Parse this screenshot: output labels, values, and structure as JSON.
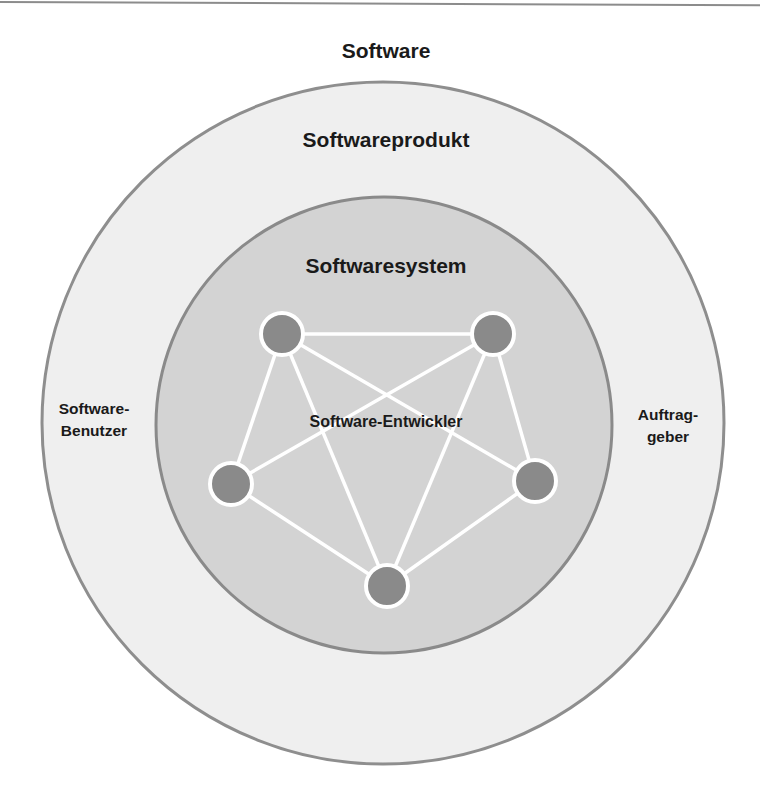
{
  "diagram": {
    "title": "Software",
    "layers": [
      {
        "id": "softwareprodukt",
        "label": "Softwareprodukt",
        "fill": "#efefef",
        "stroke": "#8e8e8e",
        "center": [
          383,
          423
        ],
        "radius": 341
      },
      {
        "id": "softwaresystem",
        "label": "Softwaresystem",
        "fill": "#d3d3d3",
        "stroke": "#8a8a8a",
        "center": [
          384,
          425
        ],
        "radius": 228
      }
    ],
    "network": {
      "label": "Software-Entwickler",
      "node_fill": "#8a8a8a",
      "node_stroke": "#ffffff",
      "edge_color": "#ffffff",
      "nodes": [
        {
          "id": "n1",
          "x": 282,
          "y": 334
        },
        {
          "id": "n2",
          "x": 493,
          "y": 334
        },
        {
          "id": "n3",
          "x": 231,
          "y": 484
        },
        {
          "id": "n4",
          "x": 535,
          "y": 481
        },
        {
          "id": "n5",
          "x": 387,
          "y": 586
        }
      ],
      "edges": [
        [
          "n1",
          "n2"
        ],
        [
          "n1",
          "n3"
        ],
        [
          "n1",
          "n4"
        ],
        [
          "n1",
          "n5"
        ],
        [
          "n2",
          "n3"
        ],
        [
          "n2",
          "n4"
        ],
        [
          "n2",
          "n5"
        ],
        [
          "n3",
          "n5"
        ],
        [
          "n4",
          "n5"
        ]
      ]
    },
    "side_labels": {
      "left": {
        "line1": "Software-",
        "line2": "Benutzer"
      },
      "right": {
        "line1": "Auftrag-",
        "line2": "geber"
      }
    }
  }
}
